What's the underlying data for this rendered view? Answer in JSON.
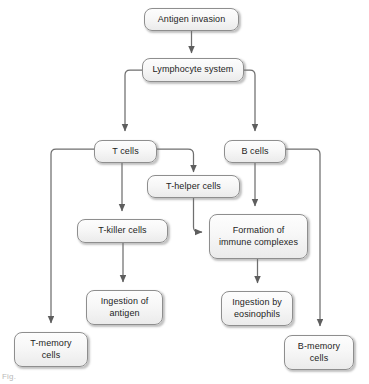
{
  "figure": {
    "caption": "Fig.",
    "style": {
      "node_fill_top": "#fdfdfd",
      "node_fill_bottom": "#ebebeb",
      "node_border": "#8e8e8e",
      "edge_color": "#6f6f6f",
      "text_color": "#1d1d1d",
      "background": "#ffffff"
    }
  },
  "nodes": [
    {
      "id": "antigen_invasion",
      "label": "Antigen invasion",
      "x": 144,
      "y": 8,
      "w": 95,
      "h": 23
    },
    {
      "id": "lymphocyte_system",
      "label": "Lymphocyte system",
      "x": 142,
      "y": 58,
      "w": 102,
      "h": 24
    },
    {
      "id": "t_cells",
      "label": "T cells",
      "x": 94,
      "y": 140,
      "w": 63,
      "h": 23
    },
    {
      "id": "b_cells",
      "label": "B cells",
      "x": 224,
      "y": 140,
      "w": 62,
      "h": 23
    },
    {
      "id": "t_helper_cells",
      "label": "T-helper cells",
      "x": 147,
      "y": 175,
      "w": 93,
      "h": 23
    },
    {
      "id": "t_killer_cells",
      "label": "T-killer cells",
      "x": 77,
      "y": 219,
      "w": 91,
      "h": 24
    },
    {
      "id": "formation_complexes",
      "label": "Formation of\nimmune complexes",
      "x": 209,
      "y": 214,
      "w": 99,
      "h": 45
    },
    {
      "id": "ingestion_antigen",
      "label": "Ingestion of\nantigen",
      "x": 86,
      "y": 290,
      "w": 77,
      "h": 35
    },
    {
      "id": "ingestion_eosinophils",
      "label": "Ingestion by\neosinophils",
      "x": 221,
      "y": 291,
      "w": 72,
      "h": 35
    },
    {
      "id": "t_memory_cells",
      "label": "T-memory\ncells",
      "x": 14,
      "y": 332,
      "w": 74,
      "h": 35
    },
    {
      "id": "b_memory_cells",
      "label": "B-memory\ncells",
      "x": 284,
      "y": 335,
      "w": 70,
      "h": 35
    }
  ],
  "edges": [
    {
      "id": "e-antigen-lymphocyte",
      "from": "antigen_invasion",
      "to": "lymphocyte_system",
      "path": "M 191.5 31 L 191.5 53"
    },
    {
      "id": "e-lymphocyte-tcells",
      "from": "lymphocyte_system",
      "to": "t_cells",
      "path": "M 142 70 L 130 70 Q 125 70 125 75 L 125 131"
    },
    {
      "id": "e-lymphocyte-bcells",
      "from": "lymphocyte_system",
      "to": "b_cells",
      "path": "M 244 70 L 250 70 Q 255 70 255 75 L 255 131"
    },
    {
      "id": "e-tcells-tmemory",
      "from": "t_cells",
      "to": "t_memory_cells",
      "path": "M 94 149 L 56 149 Q 51 149 51 154 L 51 323"
    },
    {
      "id": "e-tcells-thelper",
      "from": "t_cells",
      "to": "t_helper_cells",
      "path": "M 157 149 L 188 149 Q 193.5 149 193.5 154 L 193.5 172"
    },
    {
      "id": "e-tcells-tkiller",
      "from": "t_cells",
      "to": "t_killer_cells",
      "path": "M 122 163 L 122 211"
    },
    {
      "id": "e-thelper-formation",
      "from": "t_helper_cells",
      "to": "formation_complexes",
      "path": "M 193.5 198 L 193.5 227 Q 193.5 232 198.5 232 L 202 232"
    },
    {
      "id": "e-tkiller-ingestion",
      "from": "t_killer_cells",
      "to": "ingestion_antigen",
      "path": "M 123 243 L 123 282"
    },
    {
      "id": "e-bcells-formation",
      "from": "b_cells",
      "to": "formation_complexes",
      "path": "M 255 163 L 255 206"
    },
    {
      "id": "e-bcells-bmemory",
      "from": "b_cells",
      "to": "b_memory_cells",
      "path": "M 286 149 L 315 149 Q 320 149 320 154 L 320 326"
    },
    {
      "id": "e-formation-ingestion",
      "from": "formation_complexes",
      "to": "ingestion_eosinophils",
      "path": "M 257.5 259 L 257.5 283"
    },
    {
      "id": "e-lymph-tmemory-arrow",
      "from": "t_cells",
      "to": "t_memory_cells",
      "path": ""
    }
  ]
}
